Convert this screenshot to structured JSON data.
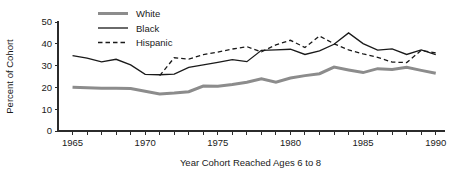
{
  "chart_data": {
    "type": "line",
    "title": "",
    "xlabel": "Year Cohort Reached Ages 6 to 8",
    "ylabel": "Percent of Cohort",
    "xlim": [
      1964,
      1990.5
    ],
    "ylim": [
      0,
      50
    ],
    "grid": false,
    "legend_position": "top-left-inside",
    "xticks": [
      1965,
      1966,
      1967,
      1968,
      1969,
      1970,
      1971,
      1972,
      1973,
      1974,
      1975,
      1976,
      1977,
      1978,
      1979,
      1980,
      1981,
      1982,
      1983,
      1984,
      1985,
      1986,
      1987,
      1988,
      1989,
      1990
    ],
    "xtick_labels": [
      "1965",
      "",
      "",
      "",
      "",
      "1970",
      "",
      "",
      "",
      "",
      "1975",
      "",
      "",
      "",
      "",
      "1980",
      "",
      "",
      "",
      "",
      "1985",
      "",
      "",
      "",
      "",
      "1990"
    ],
    "yticks": [
      0,
      10,
      20,
      30,
      40,
      50
    ],
    "ytick_labels": [
      "0",
      "10",
      "20",
      "30",
      "40",
      "50"
    ],
    "x": [
      1965,
      1966,
      1967,
      1968,
      1969,
      1970,
      1971,
      1972,
      1973,
      1974,
      1975,
      1976,
      1977,
      1978,
      1979,
      1980,
      1981,
      1982,
      1983,
      1984,
      1985,
      1986,
      1987,
      1988,
      1989,
      1990
    ],
    "series": [
      {
        "name": "White",
        "color": "#8c8c8c",
        "style": "solid",
        "width": 3.0,
        "x": [
          1965,
          1966,
          1967,
          1968,
          1969,
          1970,
          1971,
          1972,
          1973,
          1974,
          1975,
          1976,
          1977,
          1978,
          1979,
          1980,
          1981,
          1982,
          1983,
          1984,
          1985,
          1986,
          1987,
          1988,
          1989,
          1990
        ],
        "values": [
          20.1,
          19.8,
          19.6,
          19.6,
          19.5,
          18.2,
          17.0,
          17.4,
          18.0,
          20.6,
          20.5,
          21.3,
          22.4,
          24.0,
          22.4,
          24.3,
          25.4,
          26.3,
          29.3,
          28.0,
          26.8,
          28.6,
          28.2,
          29.2,
          27.8,
          26.5
        ]
      },
      {
        "name": "Black",
        "color": "#1a1a1a",
        "style": "solid",
        "width": 1.3,
        "x": [
          1965,
          1966,
          1967,
          1968,
          1969,
          1970,
          1971,
          1972,
          1973,
          1974,
          1975,
          1976,
          1977,
          1978,
          1979,
          1980,
          1981,
          1982,
          1983,
          1984,
          1985,
          1986,
          1987,
          1988,
          1989,
          1990
        ],
        "values": [
          34.6,
          33.4,
          31.7,
          32.9,
          30.3,
          26.0,
          25.8,
          26.1,
          29.2,
          30.3,
          31.5,
          32.7,
          31.8,
          37.0,
          37.2,
          37.5,
          35.1,
          36.8,
          39.8,
          45.0,
          40.1,
          37.1,
          37.7,
          35.1,
          37.2,
          35.0
        ]
      },
      {
        "name": "Hispanic",
        "color": "#1a1a1a",
        "style": "dashed",
        "width": 1.3,
        "x": [
          1971,
          1972,
          1973,
          1974,
          1975,
          1976,
          1977,
          1978,
          1979,
          1980,
          1981,
          1982,
          1983,
          1984,
          1985,
          1986,
          1987,
          1988,
          1989,
          1990
        ],
        "values": [
          25.4,
          33.6,
          33.0,
          35.0,
          36.2,
          37.6,
          38.7,
          36.3,
          39.5,
          41.6,
          38.3,
          43.6,
          40.0,
          37.2,
          35.4,
          33.8,
          31.6,
          31.4,
          37.0,
          35.8
        ]
      }
    ],
    "legend": [
      {
        "label": "White",
        "color": "#8c8c8c",
        "style": "solid",
        "width": 3.0
      },
      {
        "label": "Black",
        "color": "#1a1a1a",
        "style": "solid",
        "width": 1.3
      },
      {
        "label": "Hispanic",
        "color": "#1a1a1a",
        "style": "dashed",
        "width": 1.3
      }
    ]
  }
}
